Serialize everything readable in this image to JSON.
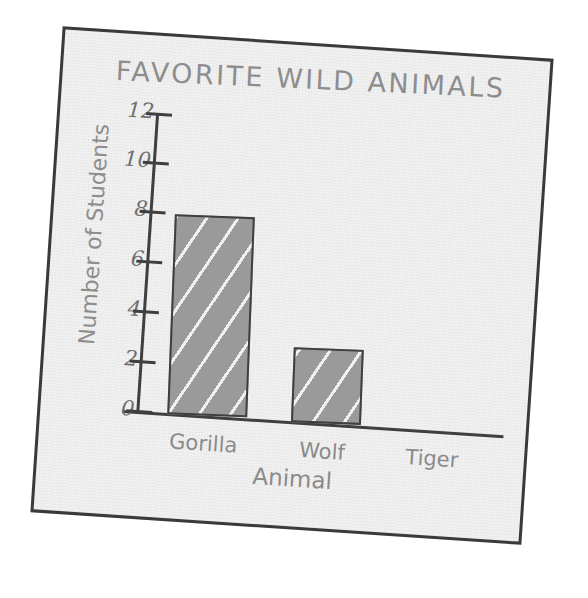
{
  "chart_data": {
    "type": "bar",
    "title": "FAVORITE WILD ANIMALS",
    "xlabel": "Animal",
    "ylabel": "Number of Students",
    "categories": [
      "Gorilla",
      "Wolf",
      "Tiger"
    ],
    "values": [
      8,
      3,
      0
    ],
    "ylim": [
      0,
      12
    ],
    "ytick_labels": [
      "12",
      "10",
      "8",
      "6",
      "4",
      "2",
      "0"
    ],
    "ytick_values": [
      12,
      10,
      8,
      6,
      4,
      2,
      0
    ],
    "grid": false,
    "legend": false,
    "style": {
      "bar_fill": "#9a9a9a",
      "bar_stroke": "#3f3f3f",
      "axis_color": "#3f3f3f",
      "text_color": "#8a8a8a",
      "paper_color": "#f1f1f1",
      "frame_color": "#3a3a3a",
      "background": "#ffffff"
    }
  }
}
